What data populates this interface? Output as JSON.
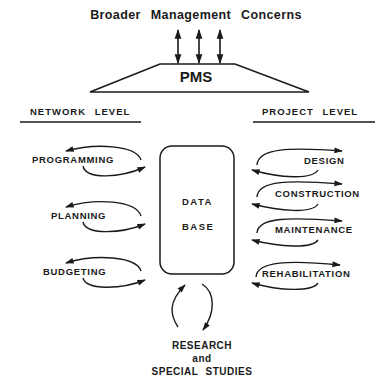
{
  "diagram": {
    "title": "Broader Management Concerns",
    "center": "PMS",
    "network_level": {
      "heading": "NETWORK LEVEL",
      "activities": [
        "PROGRAMMING",
        "PLANNING",
        "BUDGETING"
      ]
    },
    "project_level": {
      "heading": "PROJECT LEVEL",
      "activities": [
        "DESIGN",
        "CONSTRUCTION",
        "MAINTENANCE",
        "REHABILITATION"
      ]
    },
    "database": {
      "line1": "DATA",
      "line2": "BASE"
    },
    "research": {
      "line1": "RESEARCH",
      "line2": "and",
      "line3": "SPECIAL STUDIES"
    },
    "colors": {
      "ink": "#1a1a1a",
      "background": "#ffffff"
    }
  }
}
